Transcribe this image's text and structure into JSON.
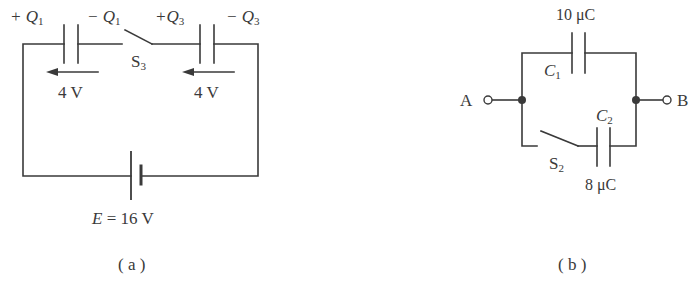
{
  "figure_a": {
    "caption": "( a )",
    "capacitor1": {
      "plus_label": "+ Q",
      "plus_sub": "1",
      "minus_label": "− Q",
      "minus_sub": "1",
      "voltage": "4 V"
    },
    "capacitor3": {
      "plus_label": "+Q",
      "plus_sub": "3",
      "minus_label": "− Q",
      "minus_sub": "3",
      "voltage": "4 V"
    },
    "switch": {
      "label": "S",
      "sub": "3"
    },
    "battery": {
      "label_var": "E",
      "label_rest": " = 16 V"
    }
  },
  "figure_b": {
    "caption": "( b )",
    "terminal_a": "A",
    "terminal_b": "B",
    "capacitor1": {
      "name": "C",
      "sub": "1",
      "value": "10 μC"
    },
    "capacitor2": {
      "name": "C",
      "sub": "2",
      "value": "8 μC"
    },
    "switch": {
      "label": "S",
      "sub": "2"
    }
  },
  "colors": {
    "line": "#3a3a3a",
    "background": "#ffffff"
  }
}
